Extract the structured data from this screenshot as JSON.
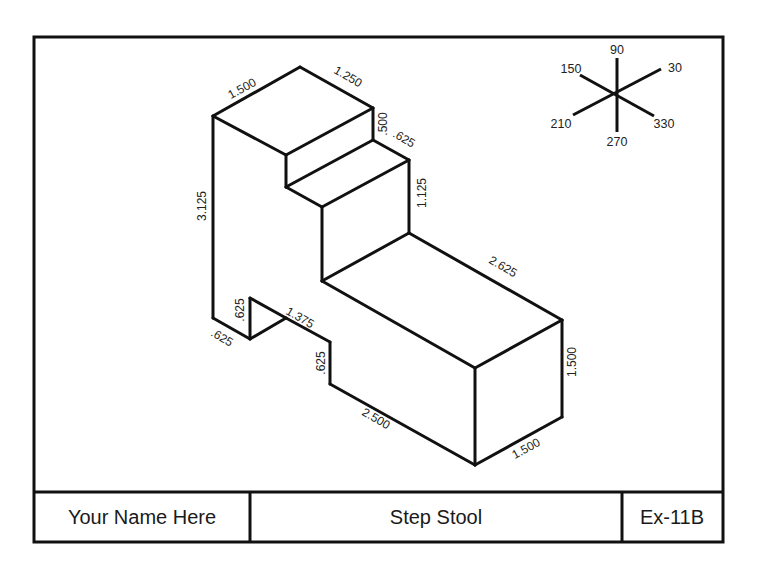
{
  "drawing": {
    "title_block": {
      "name": "Your Name Here",
      "title": "Step Stool",
      "number": "Ex-11B"
    },
    "dimensions": {
      "top_left_width": "1.500",
      "top_depth": "1.250",
      "upper_step_rise": ".500",
      "upper_step_run": ".625",
      "lower_step_rise": "1.125",
      "seat_length": "2.625",
      "front_height": "1.500",
      "front_width": "1.500",
      "base_length": "2.500",
      "back_height": "3.125",
      "notch_height": ".625",
      "notch_depth": ".625",
      "notch_run": "1.375",
      "base_step": ".625"
    },
    "iso_axes": {
      "label_90": "90",
      "label_30": "30",
      "label_150": "150",
      "label_210": "210",
      "label_270": "270",
      "label_330": "330"
    }
  }
}
